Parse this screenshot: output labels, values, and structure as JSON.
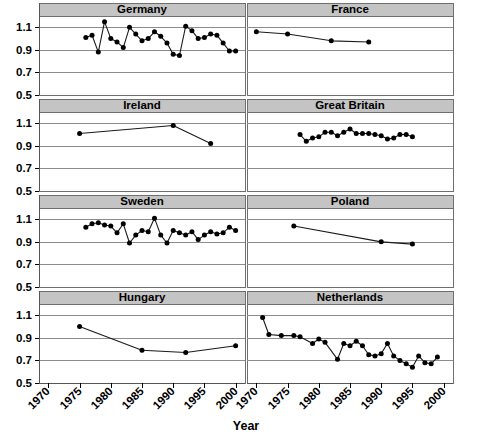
{
  "chart_data": {
    "type": "line",
    "title": "",
    "xlabel": "Year",
    "ylabel": "",
    "xlim": [
      1968.5,
      2001.5
    ],
    "ylim": [
      0.5,
      1.2
    ],
    "xticks": [
      1970,
      1975,
      1980,
      1985,
      1990,
      1995,
      2000
    ],
    "xtick_labels": [
      "1970",
      "1975",
      "1980",
      "1985",
      "1990",
      "1995",
      "2000"
    ],
    "yticks": [
      0.5,
      0.7,
      0.9,
      1.1
    ],
    "ytick_labels": [
      "0.5",
      "0.7",
      "0.9",
      "1.1"
    ],
    "grid": true,
    "legend": "none",
    "layout": "8 panels, 4 rows x 2 columns, shared axes",
    "panels": [
      {
        "name": "Germany",
        "row": 0,
        "col": 0,
        "x": [
          1976,
          1977,
          1978,
          1979,
          1980,
          1981,
          1982,
          1983,
          1984,
          1985,
          1986,
          1987,
          1988,
          1989,
          1990,
          1991,
          1992,
          1993,
          1994,
          1995,
          1996,
          1997,
          1998,
          1999,
          2000
        ],
        "y": [
          1.01,
          1.03,
          0.88,
          1.15,
          1.0,
          0.97,
          0.92,
          1.1,
          1.04,
          0.98,
          1.0,
          1.06,
          1.02,
          0.96,
          0.86,
          0.85,
          1.11,
          1.07,
          1.0,
          1.01,
          1.04,
          1.03,
          0.96,
          0.89,
          0.89
        ]
      },
      {
        "name": "France",
        "row": 0,
        "col": 1,
        "x": [
          1970,
          1975,
          1982,
          1988
        ],
        "y": [
          1.06,
          1.04,
          0.98,
          0.97
        ]
      },
      {
        "name": "Ireland",
        "row": 1,
        "col": 0,
        "x": [
          1975,
          1990,
          1996
        ],
        "y": [
          1.01,
          1.08,
          0.92
        ]
      },
      {
        "name": "Great Britain",
        "row": 1,
        "col": 1,
        "x": [
          1977,
          1978,
          1979,
          1980,
          1981,
          1982,
          1983,
          1984,
          1985,
          1986,
          1987,
          1988,
          1989,
          1990,
          1991,
          1992,
          1993,
          1994,
          1995
        ],
        "y": [
          1.0,
          0.94,
          0.97,
          0.98,
          1.02,
          1.02,
          0.99,
          1.02,
          1.05,
          1.01,
          1.01,
          1.01,
          1.0,
          0.99,
          0.96,
          0.97,
          1.0,
          1.0,
          0.98
        ]
      },
      {
        "name": "Sweden",
        "row": 2,
        "col": 0,
        "x": [
          1976,
          1977,
          1978,
          1979,
          1980,
          1981,
          1982,
          1983,
          1984,
          1985,
          1986,
          1987,
          1988,
          1989,
          1990,
          1991,
          1992,
          1993,
          1994,
          1995,
          1996,
          1997,
          1998,
          1999,
          2000
        ],
        "y": [
          1.03,
          1.06,
          1.07,
          1.05,
          1.04,
          0.98,
          1.06,
          0.89,
          0.96,
          1.0,
          0.99,
          1.11,
          0.96,
          0.89,
          1.0,
          0.98,
          0.96,
          0.99,
          0.92,
          0.96,
          0.99,
          0.97,
          0.98,
          1.03,
          1.0
        ]
      },
      {
        "name": "Poland",
        "row": 2,
        "col": 1,
        "x": [
          1976,
          1990,
          1995
        ],
        "y": [
          1.04,
          0.9,
          0.88
        ]
      },
      {
        "name": "Hungary",
        "row": 3,
        "col": 0,
        "x": [
          1975,
          1985,
          1992,
          2000
        ],
        "y": [
          1.0,
          0.79,
          0.77,
          0.83
        ]
      },
      {
        "name": "Netherlands",
        "row": 3,
        "col": 1,
        "x": [
          1971,
          1972,
          1974,
          1976,
          1977,
          1979,
          1980,
          1981,
          1983,
          1984,
          1985,
          1986,
          1987,
          1988,
          1989,
          1990,
          1991,
          1992,
          1993,
          1994,
          1995,
          1996,
          1997,
          1998,
          1999
        ],
        "y": [
          1.08,
          0.93,
          0.92,
          0.92,
          0.91,
          0.85,
          0.89,
          0.86,
          0.71,
          0.85,
          0.83,
          0.87,
          0.83,
          0.75,
          0.74,
          0.76,
          0.85,
          0.74,
          0.7,
          0.67,
          0.64,
          0.74,
          0.68,
          0.67,
          0.73
        ]
      }
    ]
  }
}
